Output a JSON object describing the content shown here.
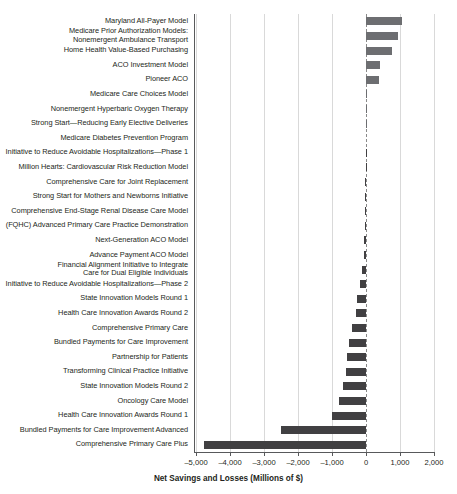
{
  "chart_data": {
    "type": "bar",
    "orientation": "horizontal",
    "title": "",
    "xlabel": "Net Savings and Losses (Millions of $)",
    "ylabel": "",
    "xlim": [
      -5000,
      2000
    ],
    "xticks": [
      -5000,
      -4000,
      -3000,
      -2000,
      -1000,
      0,
      1000,
      2000
    ],
    "xticklabels": [
      "–5,000",
      "–4,000",
      "–3,000",
      "–2,000",
      "–1,000",
      "0",
      "1,000",
      "2,000"
    ],
    "grid": true,
    "legend": false,
    "categories": [
      "Maryland All-Payer Model",
      "Medicare Prior Authorization Models:\nNonemergent Ambulance Transport",
      "Home Health Value-Based Purchasing",
      "ACO Investment Model",
      "Pioneer ACO",
      "Medicare Care Choices Model",
      "Nonemergent Hyperbaric Oxygen Therapy",
      "Strong Start—Reducing Early Elective Deliveries",
      "Medicare Diabetes Prevention Program",
      "Initiative to Reduce Avoidable Hospitalizations—Phase 1",
      "Million Hearts: Cardiovascular Risk Reduction Model",
      "Comprehensive Care for Joint Replacement",
      "Strong Start for Mothers and Newborns Initiative",
      "Comprehensive End-Stage Renal Disease Care Model",
      "(FQHC) Advanced Primary Care Practice Demonstration",
      "Next-Generation ACO Model",
      "Advance Payment ACO Model",
      "Financial Alignment Initiative to Integrate\nCare for Dual Eligible Individuals",
      "Initiative to Reduce Avoidable Hospitalizations—Phase 2",
      "State Innovation Models Round 1",
      "Health Care Innovation Awards Round 2",
      "Comprehensive Primary Care",
      "Bundled Payments for Care Improvement",
      "Partnership for Patients",
      "Transforming Clinical Practice Initiative",
      "State Innovation Models Round 2",
      "Oncology Care Model",
      "Health Care Innovation Awards Round 1",
      "Bundled Payments for Care Improvement Advanced",
      "Comprehensive Primary Care Plus"
    ],
    "values": [
      1060,
      940,
      760,
      400,
      380,
      20,
      10,
      5,
      0,
      -5,
      -10,
      -15,
      -20,
      -30,
      -40,
      -60,
      -70,
      -110,
      -190,
      -260,
      -290,
      -400,
      -500,
      -560,
      -600,
      -680,
      -790,
      -1000,
      -2500,
      -4760
    ],
    "colors": {
      "positive_bar": "#6d6e71",
      "negative_bar": "#414042",
      "gridline": "#d9d9d9",
      "axis": "#58595b",
      "text": "#231f20"
    }
  }
}
